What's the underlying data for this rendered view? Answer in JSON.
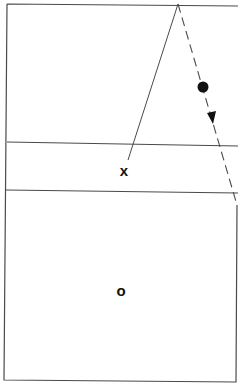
{
  "diagram": {
    "type": "court-play-diagram",
    "colors": {
      "line": "#4a4a4a",
      "marker": "#111111",
      "background": "#ffffff"
    },
    "court": {
      "outline": {
        "x1": 7,
        "y1": 3,
        "x2": 236,
        "y2": 380
      },
      "divider_lines_y": [
        142,
        190
      ]
    },
    "players": [
      {
        "id": "x",
        "label": "x",
        "x": 124,
        "y": 170
      },
      {
        "id": "o",
        "label": "o",
        "x": 121,
        "y": 291
      }
    ],
    "ball": {
      "x": 203,
      "y": 87,
      "r": 5
    },
    "paths": [
      {
        "name": "pass-path",
        "style": "solid",
        "from": [
          178,
          4
        ],
        "to": [
          128,
          160
        ]
      },
      {
        "name": "ball-movement-path",
        "style": "dashed",
        "from": [
          178,
          4
        ],
        "to": [
          237,
          205
        ],
        "arrow_at": [
          211,
          120
        ]
      }
    ]
  }
}
